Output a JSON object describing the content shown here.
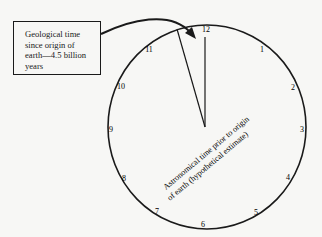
{
  "diagram": {
    "callout": {
      "text": "Geological time\nsince origin of\nearth—4.5 billion\nyears"
    },
    "clock": {
      "numerals": [
        "12",
        "1",
        "2",
        "3",
        "4",
        "5",
        "6",
        "7",
        "8",
        "9",
        "10",
        "11"
      ],
      "label_line1": "Astronomical time prior to origin",
      "label_line2": "of earth (hypothetical estimate)"
    },
    "colors": {
      "ink": "#1a1a1a",
      "paper": "#f7f7f5"
    }
  }
}
